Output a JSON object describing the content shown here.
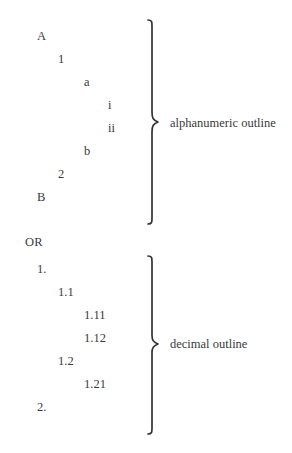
{
  "document": {
    "title": "Outline numbering styles",
    "background_color": "#ffffff",
    "text_color": "#3a3a3a"
  },
  "connector": {
    "label": "OR"
  },
  "groups": [
    {
      "id": "alphanumeric",
      "caption": "alphanumeric outline",
      "brace": {
        "top": 20,
        "bottom": 222,
        "tip_y": 122
      },
      "items": [
        {
          "label": "A",
          "level": 0,
          "row": 0
        },
        {
          "label": "1",
          "level": 1,
          "row": 1
        },
        {
          "label": "a",
          "level": 2,
          "row": 2
        },
        {
          "label": "i",
          "level": 3,
          "row": 3
        },
        {
          "label": "ii",
          "level": 3,
          "row": 4
        },
        {
          "label": "b",
          "level": 2,
          "row": 5
        },
        {
          "label": "2",
          "level": 1,
          "row": 6
        },
        {
          "label": "B",
          "level": 0,
          "row": 7
        }
      ]
    },
    {
      "id": "decimal",
      "caption": "decimal outline",
      "brace": {
        "top": 256,
        "bottom": 432,
        "tip_y": 344
      },
      "items": [
        {
          "label": "1.",
          "level": 0,
          "row": 0
        },
        {
          "label": "1.1",
          "level": 1,
          "row": 1
        },
        {
          "label": "1.11",
          "level": 2,
          "row": 2
        },
        {
          "label": "1.12",
          "level": 2,
          "row": 3
        },
        {
          "label": "1.2",
          "level": 1,
          "row": 4
        },
        {
          "label": "1.21",
          "level": 2,
          "row": 5
        },
        {
          "label": "2.",
          "level": 0,
          "row": 6
        }
      ]
    }
  ]
}
